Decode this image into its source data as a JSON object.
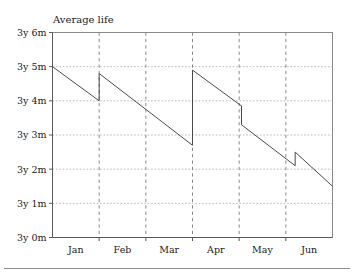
{
  "chart_data": {
    "type": "line",
    "title": "Average life",
    "xlabel": "",
    "ylabel": "",
    "grid": true,
    "legend": "none",
    "x_tick_labels": [
      "Jan",
      "Feb",
      "Mar",
      "Apr",
      "May",
      "Jun"
    ],
    "y_tick_labels": [
      "3y 0m",
      "3y 1m",
      "3y 2m",
      "3y 3m",
      "3y 4m",
      "3y 5m",
      "3y 6m"
    ],
    "y_tick_values": [
      0,
      1,
      2,
      3,
      4,
      5,
      6
    ],
    "ylim": [
      0,
      6
    ],
    "y_unit": "months above 3 years",
    "x_axis_note": "month boundaries marked by dashed vertical lines; month names centred between boundaries",
    "series": [
      {
        "name": "Average life",
        "comment": "sawtooth: steady decline interrupted by four upward jumps",
        "points": [
          {
            "x": 0.0,
            "y": 5.0
          },
          {
            "x": 1.0,
            "y": 4.0
          },
          {
            "x": 1.0,
            "y": 4.8
          },
          {
            "x": 3.0,
            "y": 2.7
          },
          {
            "x": 3.0,
            "y": 4.9
          },
          {
            "x": 4.05,
            "y": 3.85
          },
          {
            "x": 4.05,
            "y": 3.3
          },
          {
            "x": 5.2,
            "y": 2.1
          },
          {
            "x": 5.2,
            "y": 2.5
          },
          {
            "x": 6.2,
            "y": 1.5
          }
        ]
      }
    ]
  }
}
